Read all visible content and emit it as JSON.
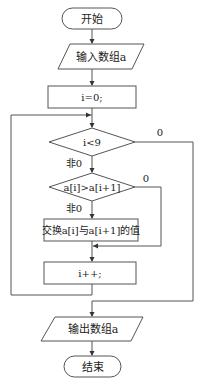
{
  "flowchart": {
    "start": {
      "label": "开始"
    },
    "input": {
      "label": "输入数组a"
    },
    "init": {
      "label": "i=0;"
    },
    "cond_outer": {
      "label": "i<9",
      "yes_label": "非0",
      "no_label": "0"
    },
    "cond_inner": {
      "label": "a[i]>a[i+1]",
      "yes_label": "非0",
      "no_label": "0"
    },
    "swap": {
      "label": "交换a[i]与a[i+1]的值"
    },
    "increment": {
      "label": "i++;"
    },
    "output": {
      "label": "输出数组a"
    },
    "end": {
      "label": "结束"
    }
  },
  "colors": {
    "stroke": "#555555",
    "text": "#222222",
    "background": "#ffffff"
  }
}
